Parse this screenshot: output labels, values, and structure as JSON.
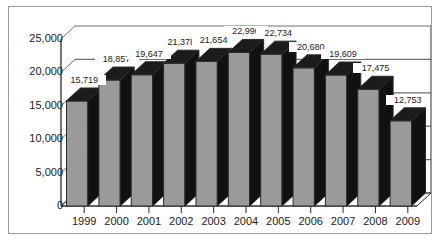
{
  "caption": {
    "text": "Figure — cut off at top edge"
  },
  "chart_data": {
    "type": "bar",
    "title": "",
    "subtitle": "",
    "xlabel": "",
    "ylabel": "",
    "categories": [
      "1999",
      "2000",
      "2001",
      "2002",
      "2003",
      "2004",
      "2005",
      "2006",
      "2007",
      "2008",
      "2009"
    ],
    "values": [
      15719,
      18857,
      19647,
      21378,
      21654,
      22990,
      22734,
      20680,
      19609,
      17475,
      12753
    ],
    "value_labels": [
      "15,719",
      "18,857",
      "19,647",
      "21,378",
      "21,654",
      "22,990",
      "22,734",
      "20,680",
      "19,609",
      "17,475",
      "12,753"
    ],
    "ylim": [
      0,
      25000
    ],
    "ytick_values": [
      0,
      5000,
      10000,
      15000,
      20000,
      25000
    ],
    "ytick_labels": [
      "0",
      "5,000",
      "10,000",
      "15,000",
      "20,000",
      "25,000"
    ],
    "grid": true,
    "legend": "none",
    "legend_position": "none",
    "style": "3d-column",
    "colors": {
      "bar_face": "#9a9a9a",
      "bar_side": "#111111",
      "bar_top": "#1b1b1b",
      "bar_outline": "#2b2b2b",
      "gridline": "#6f6f6f",
      "axis": "#2b2b2b",
      "text": "#1a1a1a",
      "frame": "#9b9b9b",
      "background": "#ffffff"
    }
  }
}
